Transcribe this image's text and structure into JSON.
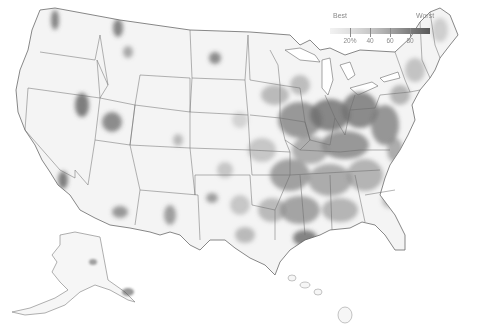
{
  "map": {
    "subject": "United States counties choropleth (grayscale)",
    "legend": {
      "best_label": "Best",
      "worst_label": "Worst",
      "ticks": [
        "20%",
        "40",
        "60",
        "80"
      ],
      "colors": [
        "#f2f2f2",
        "#e0e0e0",
        "#c8c8c8",
        "#a5a5a5",
        "#7d7d7d",
        "#5a5a5a"
      ]
    },
    "regions_shown": [
      "Contiguous United States",
      "Alaska",
      "Hawaii"
    ]
  }
}
